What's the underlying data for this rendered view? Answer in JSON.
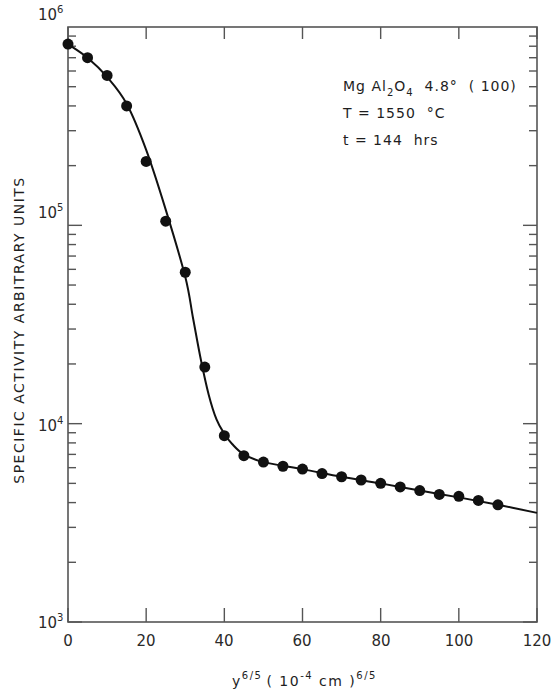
{
  "chart_data": {
    "type": "scatter",
    "title": "",
    "xlabel": "y^(6/5) (10^-4 cm)^(6/5)",
    "ylabel": "SPECIFIC ACTIVITY ARBITRARY UNITS",
    "yscale": "log",
    "xlim": [
      0,
      120
    ],
    "ylim": [
      1000,
      1000000
    ],
    "x_ticks": [
      0,
      20,
      40,
      60,
      80,
      100,
      120
    ],
    "y_ticks": [
      1000,
      10000,
      100000,
      1000000
    ],
    "y_tick_labels": [
      "10^3",
      "10^4",
      "10^5",
      "10^6"
    ],
    "grid": false,
    "legend": null,
    "annotations": [
      "MgAl2O4  4.8°  (100)",
      "T = 1550 °C",
      "t = 144 hrs"
    ],
    "series": [
      {
        "name": "measured",
        "marker": "filled-circle",
        "x": [
          0,
          5,
          10,
          15,
          20,
          25,
          30,
          35,
          40,
          45,
          50,
          55,
          60,
          65,
          70,
          75,
          80,
          85,
          90,
          95,
          100,
          105,
          110
        ],
        "values": [
          820000,
          700000,
          570000,
          400000,
          210000,
          105000,
          58000,
          19300,
          8700,
          6900,
          6400,
          6100,
          5900,
          5600,
          5400,
          5200,
          5000,
          4800,
          4600,
          4400,
          4300,
          4100,
          3900
        ]
      },
      {
        "name": "fitted curve",
        "marker": "line",
        "x": [
          0,
          5,
          10,
          15,
          20,
          25,
          30,
          32,
          34,
          36,
          38,
          40,
          42,
          45,
          50,
          60,
          70,
          80,
          90,
          100,
          110,
          120
        ],
        "values": [
          820000,
          700000,
          560000,
          410000,
          240000,
          120000,
          55000,
          34000,
          21000,
          14000,
          10500,
          8900,
          7900,
          7000,
          6400,
          5900,
          5400,
          5000,
          4600,
          4250,
          3900,
          3550
        ]
      }
    ]
  },
  "labels": {
    "ytick_base": [
      "10",
      "10",
      "10",
      "10"
    ],
    "ytick_exp": [
      "3",
      "4",
      "5",
      "6"
    ],
    "xticks": [
      "0",
      "20",
      "40",
      "60",
      "80",
      "100",
      "120"
    ],
    "ylabel": "SPECIFIC ACTIVITY ARBITRARY UNITS",
    "xlabel_y": "y",
    "xlabel_exp1": "6/5",
    "xlabel_mid": "( 10",
    "xlabel_mid_exp": "-4",
    "xlabel_unit": " cm )",
    "xlabel_exp2": "6/5",
    "ann_compound_mg": "Mg Al",
    "ann_sub2": "2",
    "ann_o": "O",
    "ann_sub4": "4",
    "ann_rest": "  4.8°  ( 100)",
    "ann_temp": "T = 1550  °C",
    "ann_time": "t = 144  hrs"
  },
  "colors": {
    "axis": "#555555",
    "ink": "#111111",
    "background": "#ffffff"
  }
}
